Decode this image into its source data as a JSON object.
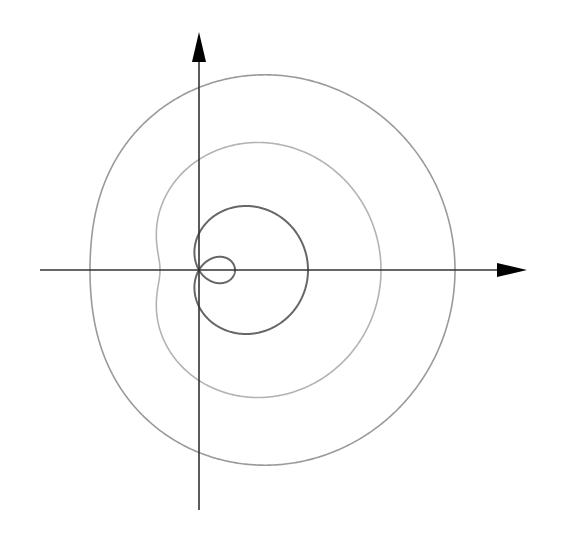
{
  "diagram": {
    "type": "polar-curves",
    "origin": {
      "x": 199,
      "y": 270
    },
    "axes": {
      "x_axis": {
        "from": 40,
        "to": 527,
        "color": "#333333"
      },
      "y_axis": {
        "from": 510,
        "to": 32,
        "color": "#333333"
      },
      "arrowheads": [
        "positive-x",
        "positive-y"
      ]
    },
    "curves": [
      {
        "name": "inner-loop-limacon",
        "a": 72.5,
        "b": 36.5,
        "color": "#666666",
        "width": 2
      },
      {
        "name": "dimpled-limacon",
        "a": 71.5,
        "b": 110.5,
        "color": "#b3b3b3",
        "width": 1.6
      },
      {
        "name": "convex-limacon",
        "a": 73.5,
        "b": 182.5,
        "color": "#9a9a9a",
        "width": 1.6
      }
    ]
  }
}
